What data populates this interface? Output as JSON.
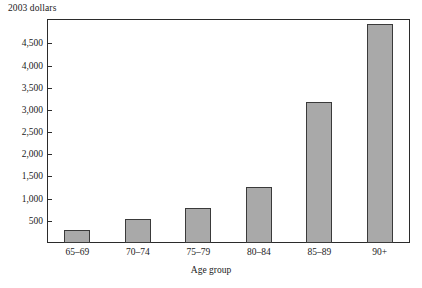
{
  "chart_data": {
    "type": "bar",
    "title": "",
    "subtitle": "",
    "unit_label": "2003 dollars",
    "xlabel": "Age group",
    "ylabel": "",
    "categories": [
      "65–69",
      "70–74",
      "75–79",
      "80–84",
      "85–89",
      "90+"
    ],
    "values": [
      300,
      540,
      780,
      1260,
      3180,
      4930
    ],
    "ylim": [
      0,
      5050
    ],
    "yticks": [
      500,
      1000,
      1500,
      2000,
      2500,
      3000,
      3500,
      4000,
      4500
    ],
    "ytick_labels": [
      "500",
      "1,000",
      "1,500",
      "2,000",
      "2,500",
      "3,000",
      "3,500",
      "4,000",
      "4,500"
    ],
    "grid": false,
    "legend": null,
    "bar_color": "#a9a9a9",
    "bar_border_color": "#3a3a3a",
    "axis_color": "#2b2b2b"
  }
}
